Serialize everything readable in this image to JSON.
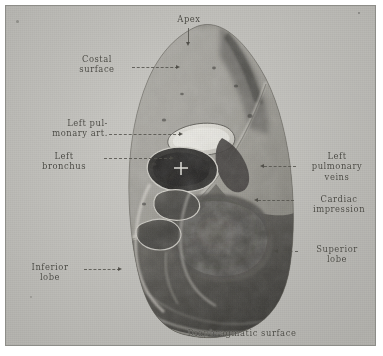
{
  "plate": {
    "medium": "halftone photographic plate",
    "subject": "Left lung, mediastinal (medial) surface",
    "background_color": "#c9c8c3",
    "ink_color": "#4a4944"
  },
  "caption": {
    "text": "Diaphragmatic surface"
  },
  "labels": [
    {
      "id": "apex",
      "name": "apex",
      "text": "Apex",
      "align": "center"
    },
    {
      "id": "costal-surface",
      "name": "costal-surface",
      "text": "Costal\nsurface",
      "align": "center"
    },
    {
      "id": "left-pulmonary-artery",
      "name": "left-pulmonary-artery",
      "text": "Left pul-\nmonary art.",
      "align": "right"
    },
    {
      "id": "left-bronchus",
      "name": "left-bronchus",
      "text": "Left\nbronchus",
      "align": "center"
    },
    {
      "id": "left-pulmonary-veins",
      "name": "left-pulmonary-veins",
      "text": "Left\npulmonary\nveins",
      "align": "center"
    },
    {
      "id": "cardiac-impression",
      "name": "cardiac-impression",
      "text": "Cardiac\nimpression",
      "align": "center"
    },
    {
      "id": "superior-lobe",
      "name": "superior-lobe",
      "text": "Superior\nlobe",
      "align": "center"
    },
    {
      "id": "inferior-lobe",
      "name": "inferior-lobe",
      "text": "Inferior\nlobe",
      "align": "center"
    },
    {
      "id": "diaphragmatic-surface",
      "name": "diaphragmatic-surface",
      "text": "Diaphragmatic surface",
      "align": "center"
    }
  ]
}
